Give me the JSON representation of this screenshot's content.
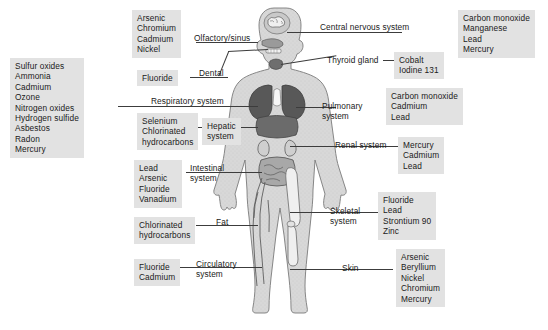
{
  "figure": {
    "type": "anatomical-diagram"
  },
  "callouts": [
    {
      "id": "olfactory",
      "system_label": "Olfactory/sinus",
      "agents": [
        "Arsenic",
        "Chromium",
        "Cadmium",
        "Nickel"
      ],
      "agents_text": "Arsenic\nChromium\nCadmium\nNickel"
    },
    {
      "id": "dental",
      "system_label": "Dental",
      "agents": [
        "Fluoride"
      ],
      "agents_text": "Fluoride"
    },
    {
      "id": "respiratory",
      "system_label": "Respiratory system",
      "agents": [
        "Sulfur oxides",
        "Ammonia",
        "Cadmium",
        "Ozone",
        "Nitrogen oxides",
        "Hydrogen sulfide",
        "Asbestos",
        "Radon",
        "Mercury"
      ],
      "agents_text": "Sulfur oxides\nAmmonia\nCadmium\nOzone\nNitrogen oxides\nHydrogen sulfide\nAsbestos\nRadon\nMercury"
    },
    {
      "id": "hepatic",
      "system_label": "Hepatic\nsystem",
      "agents": [
        "Selenium",
        "Chlorinated hydrocarbons"
      ],
      "agents_text": "Selenium\nChlorinated\nhydrocarbons"
    },
    {
      "id": "intestinal",
      "system_label": "Intestinal\nsystem",
      "agents": [
        "Lead",
        "Arsenic",
        "Fluoride",
        "Vanadium"
      ],
      "agents_text": "Lead\nArsenic\nFluoride\nVanadium"
    },
    {
      "id": "fat",
      "system_label": "Fat",
      "agents": [
        "Chlorinated hydrocarbons"
      ],
      "agents_text": "Chlorinated\nhydrocarbons"
    },
    {
      "id": "circulatory",
      "system_label": "Circulatory\nsystem",
      "agents": [
        "Fluoride",
        "Cadmium"
      ],
      "agents_text": "Fluoride\nCadmium"
    },
    {
      "id": "cns",
      "system_label": "Central nervous system",
      "agents": [
        "Carbon monoxide",
        "Manganese",
        "Lead",
        "Mercury"
      ],
      "agents_text": "Carbon monoxide\nManganese\nLead\nMercury"
    },
    {
      "id": "thyroid",
      "system_label": "Thyroid gland",
      "agents": [
        "Cobalt",
        "Iodine 131"
      ],
      "agents_text": "Cobalt\nIodine 131"
    },
    {
      "id": "pulmonary",
      "system_label": "Pulmonary\nsystem",
      "agents": [
        "Carbon monoxide",
        "Cadmium",
        "Lead"
      ],
      "agents_text": "Carbon monoxide\nCadmium\nLead"
    },
    {
      "id": "renal",
      "system_label": "Renal system",
      "agents": [
        "Mercury",
        "Cadmium",
        "Lead"
      ],
      "agents_text": "Mercury\nCadmium\nLead"
    },
    {
      "id": "skeletal",
      "system_label": "Skeletal\nsystem",
      "agents": [
        "Fluoride",
        "Lead",
        "Strontium 90",
        "Zinc"
      ],
      "agents_text": "Fluoride\nLead\nStrontium 90\nZinc"
    },
    {
      "id": "skin",
      "system_label": "Skin",
      "agents": [
        "Arsenic",
        "Beryllium",
        "Nickel",
        "Chromium",
        "Mercury"
      ],
      "agents_text": "Arsenic\nBeryllium\nNickel\nChromium\nMercury"
    }
  ],
  "colors": {
    "box_fill": "#e2e2e2",
    "text": "#1a1a1a",
    "leader_line": "#3c3c3c",
    "body_fill": "#d6d6d6",
    "body_outline": "#707070",
    "organ_dark": "#5a5a5a",
    "organ_mid": "#8e8e8e",
    "organ_light": "#c2c2c2"
  }
}
